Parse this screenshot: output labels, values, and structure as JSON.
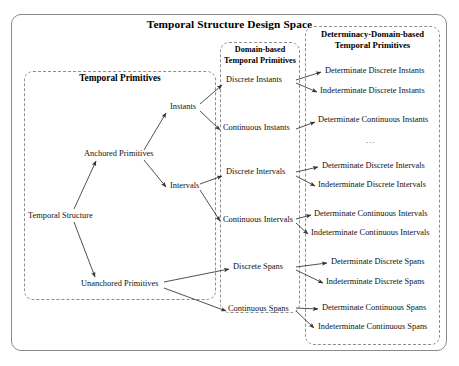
{
  "diagram": {
    "title": "Temporal Structure Design Space",
    "groups": {
      "temporal_primitives": {
        "heading": "Temporal Primitives"
      },
      "domain_based": {
        "heading_line1": "Domain-based",
        "heading_line2": "Temporal Primitives"
      },
      "determinacy_domain": {
        "heading_line1": "Determinacy-Domain-based",
        "heading_line2": "Temporal Primitives"
      }
    },
    "nodes": {
      "root": "Temporal Structure",
      "anchored": "Anchored Primitives",
      "unanchored": "Unanchored Primitives",
      "instants": "Instants",
      "intervals": "Intervals",
      "discrete_instants": "Discrete Instants",
      "continuous_instants": "Continuous Instants",
      "discrete_intervals": "Discrete Intervals",
      "continuous_intervals": "Continuous Intervals",
      "discrete_spans": "Discrete Spans",
      "continuous_spans": "Continuous Spans",
      "det_discrete_instants": "Determinate Discrete Instants",
      "indet_discrete_instants": "Indeterminate Discrete Instants",
      "det_continuous_instants": "Determinate Continuous Instants",
      "ellipsis": "...",
      "det_discrete_intervals": "Determinate Discrete Intervals",
      "indet_discrete_intervals": "Indeterminate Discrete Intervals",
      "det_continuous_intervals": "Determinate Continuous Intervals",
      "indet_continuous_intervals": "Indeterminate Continuous Intervals",
      "det_discrete_spans": "Determinate Discrete Spans",
      "indet_discrete_spans": "Indeterminate Discrete Spans",
      "det_continuous_spans": "Determinate Continuous Spans",
      "indet_continuous_spans": "Indeterminate Continuous Spans"
    },
    "colors": {
      "frame": "#8a8a8a",
      "dashed": "#8d8d8d",
      "text": "#111111",
      "arrow": "#333333",
      "background": "#ffffff"
    }
  }
}
